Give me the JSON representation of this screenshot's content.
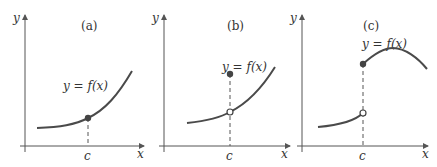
{
  "figure": {
    "panels": [
      {
        "id": "a",
        "title": "(a)",
        "function_label": "y = f(x)",
        "axis_y_label": "y",
        "axis_x_label": "x",
        "tick_label": "c",
        "description": "continuous at c"
      },
      {
        "id": "b",
        "title": "(b)",
        "function_label": "y = f(x)",
        "axis_y_label": "y",
        "axis_x_label": "x",
        "tick_label": "c",
        "description": "removable discontinuity at c: open circle on curve, filled point above"
      },
      {
        "id": "c",
        "title": "(c)",
        "function_label": "y = f(x)",
        "axis_y_label": "y",
        "axis_x_label": "x",
        "tick_label": "c",
        "description": "jump discontinuity at c: open circle on left branch, filled point starting right branch"
      }
    ],
    "colors": {
      "curve": "#4a4a4a",
      "axis": "#555555",
      "dot": "#444444"
    }
  }
}
